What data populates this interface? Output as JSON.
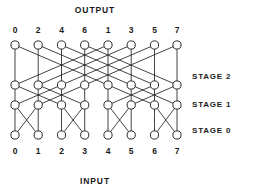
{
  "figure": {
    "title_top": "OUTPUT",
    "title_bottom": "INPUT",
    "background_color": "#ffffff",
    "line_color": "#222222",
    "node_fill": "#ffffff"
  },
  "labels": {
    "output_row": [
      "0",
      "2",
      "4",
      "6",
      "1",
      "3",
      "5",
      "7"
    ],
    "input_row": [
      "0",
      "1",
      "2",
      "3",
      "4",
      "5",
      "6",
      "7"
    ],
    "stages": [
      "STAGE 2",
      "STAGE 1",
      "STAGE 0"
    ]
  },
  "chart_data": {
    "type": "diagram",
    "title": "OUTPUT",
    "subtitle": "INPUT",
    "diagram_kind": "butterfly-network",
    "columns": 8,
    "rows": 4,
    "output_labels": [
      "0",
      "2",
      "4",
      "6",
      "1",
      "3",
      "5",
      "7"
    ],
    "input_labels": [
      "0",
      "1",
      "2",
      "3",
      "4",
      "5",
      "6",
      "7"
    ],
    "stage_labels": [
      "STAGE 2",
      "STAGE 1",
      "STAGE 0"
    ],
    "node_x": [
      15,
      38.2,
      61.5,
      84.7,
      108,
      131.2,
      154.5,
      177
    ],
    "node_y": [
      45,
      85,
      105,
      135
    ],
    "node_radius": 4.1,
    "stages": [
      {
        "name": "STAGE 0",
        "stride": 1,
        "from_row": 3,
        "to_row": 2,
        "straight": [
          [
            0,
            0
          ],
          [
            1,
            1
          ],
          [
            2,
            2
          ],
          [
            3,
            3
          ],
          [
            4,
            4
          ],
          [
            5,
            5
          ],
          [
            6,
            6
          ],
          [
            7,
            7
          ]
        ],
        "cross": [
          [
            0,
            1
          ],
          [
            1,
            0
          ],
          [
            2,
            3
          ],
          [
            3,
            2
          ],
          [
            4,
            5
          ],
          [
            5,
            4
          ],
          [
            6,
            7
          ],
          [
            7,
            6
          ]
        ]
      },
      {
        "name": "STAGE 1",
        "stride": 2,
        "from_row": 2,
        "to_row": 1,
        "straight": [
          [
            0,
            0
          ],
          [
            1,
            1
          ],
          [
            2,
            2
          ],
          [
            3,
            3
          ],
          [
            4,
            4
          ],
          [
            5,
            5
          ],
          [
            6,
            6
          ],
          [
            7,
            7
          ]
        ],
        "cross": [
          [
            0,
            2
          ],
          [
            2,
            0
          ],
          [
            1,
            3
          ],
          [
            3,
            1
          ],
          [
            4,
            6
          ],
          [
            6,
            4
          ],
          [
            5,
            7
          ],
          [
            7,
            5
          ]
        ]
      },
      {
        "name": "STAGE 2",
        "stride": 4,
        "from_row": 1,
        "to_row": 0,
        "straight": [
          [
            0,
            0
          ],
          [
            1,
            1
          ],
          [
            2,
            2
          ],
          [
            3,
            3
          ],
          [
            4,
            4
          ],
          [
            5,
            5
          ],
          [
            6,
            6
          ],
          [
            7,
            7
          ]
        ],
        "cross": [
          [
            0,
            4
          ],
          [
            4,
            0
          ],
          [
            1,
            5
          ],
          [
            5,
            1
          ],
          [
            2,
            6
          ],
          [
            6,
            2
          ],
          [
            3,
            7
          ],
          [
            7,
            3
          ]
        ]
      }
    ],
    "stage_label_y": [
      72,
      100,
      126
    ],
    "xlabel": "",
    "ylabel": "",
    "grid": false,
    "legend": "none"
  }
}
